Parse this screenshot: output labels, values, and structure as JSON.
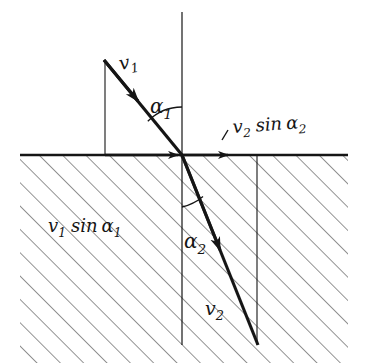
{
  "figure": {
    "type": "physics-diagram",
    "background_color": "#ffffff",
    "ink_color": "#151515",
    "hatch_color": "#444444"
  },
  "labels": {
    "incident_speed": "v₁",
    "incident_angle": "α₁",
    "refracted_speed": "v₂",
    "refracted_angle": "α₂",
    "upper_projection": "v₂ sin α₂",
    "lower_projection": "v₁ sin α₁"
  },
  "label_parts": {
    "v1_base": "v",
    "v1_sub": "1",
    "v2_base": "v",
    "v2_sub": "2",
    "alpha1_base": "α",
    "alpha1_sub": "1",
    "alpha2_base": "α",
    "alpha2_sub": "2",
    "sin": "sin"
  },
  "geometry": {
    "origin": {
      "x": 182,
      "y": 155
    },
    "interface_line": {
      "x1": 20,
      "y1": 155,
      "x2": 348,
      "y2": 155
    },
    "normal_line": {
      "x1": 182,
      "y1": 12,
      "x2": 182,
      "y2": 345
    },
    "incident_ray": {
      "x1": 104,
      "y1": 60,
      "x2": 182,
      "y2": 155
    },
    "refracted_ray": {
      "x1": 182,
      "y1": 155,
      "x2": 258,
      "y2": 345
    },
    "left_dropline": {
      "x1": 105,
      "y1": 60,
      "x2": 105,
      "y2": 155
    },
    "right_dropline": {
      "x1": 257,
      "y1": 155,
      "x2": 257,
      "y2": 345
    },
    "interface_arrow_left": {
      "x1": 105,
      "y1": 155,
      "x2": 182,
      "y2": 155
    },
    "interface_arrow_right": {
      "x1": 182,
      "y1": 155,
      "x2": 232,
      "y2": 155
    },
    "alpha1_arc_radius": 48,
    "alpha2_arc_radius": 52,
    "hatch_angle_deg": 45,
    "hatch_spacing_px": 16.5,
    "hatch_region": {
      "x": 20,
      "y": 155,
      "width": 328,
      "height": 208
    }
  },
  "label_positions": {
    "v1": {
      "x": 120,
      "y": 67
    },
    "alpha1": {
      "x": 152,
      "y": 110
    },
    "upper_projection": {
      "x": 232,
      "y": 131
    },
    "lower_projection": {
      "x": 48,
      "y": 228
    },
    "alpha2": {
      "x": 183,
      "y": 244
    },
    "v2": {
      "x": 205,
      "y": 312
    }
  }
}
